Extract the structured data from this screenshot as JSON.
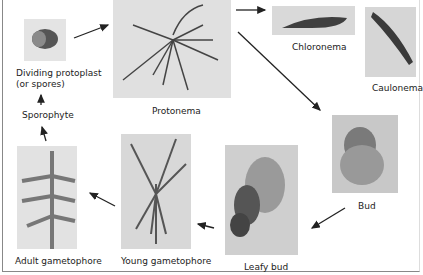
{
  "diagram": {
    "stages": [
      {
        "id": "protoplast",
        "label_line1": "Dividing protoplast",
        "label_line2": "(or spores)"
      },
      {
        "id": "protonema",
        "label": "Protonema"
      },
      {
        "id": "chloronema",
        "label": "Chloronema"
      },
      {
        "id": "caulonema",
        "label": "Caulonema"
      },
      {
        "id": "bud",
        "label": "Bud"
      },
      {
        "id": "leafy-bud",
        "label": "Leafy bud"
      },
      {
        "id": "young-gametophore",
        "label": "Young gametophore"
      },
      {
        "id": "adult-gametophore",
        "label": "Adult gametophore"
      },
      {
        "id": "sporophyte",
        "label": "Sporophyte"
      }
    ],
    "flow": [
      "Dividing protoplast (or spores) -> Protonema",
      "Protonema -> Chloronema",
      "Protonema -> Bud",
      "Bud -> Leafy bud",
      "Leafy bud -> Young gametophore",
      "Young gametophore -> Adult gametophore",
      "Adult gametophore -> Sporophyte",
      "Sporophyte -> Dividing protoplast (or spores)"
    ],
    "colors": {
      "panel": "#d6d6d6",
      "arrow": "#222222",
      "cell": "#3a3a3a"
    }
  }
}
